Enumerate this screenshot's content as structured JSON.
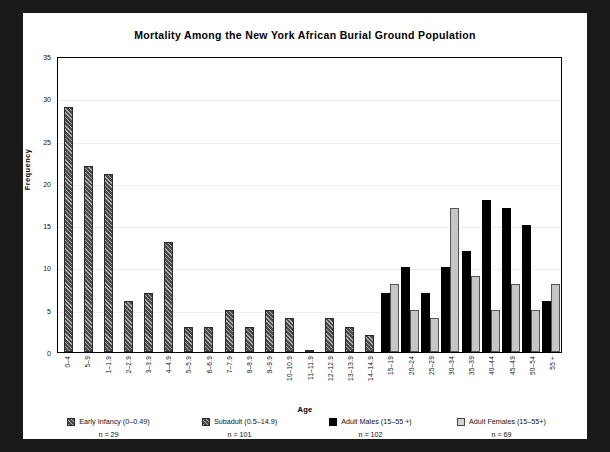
{
  "figure": {
    "title": "Mortality Among the New York African Burial Ground Population",
    "background": "#ffffff",
    "frame_color": "#1a1a1a"
  },
  "axes": {
    "x_label": "Age",
    "y_label": "Frequency",
    "y_ticks": [
      "0",
      "5",
      "10",
      "15",
      "20",
      "25",
      "30",
      "35"
    ]
  },
  "legend": {
    "items": [
      {
        "label": "Early Infancy (0–0.49)",
        "n": "n = 29",
        "swatch": "hatch",
        "color": "#4a4a4a"
      },
      {
        "label": "Subadult (0.5–14.9)",
        "n": "n = 101",
        "swatch": "hatch",
        "color": "#4a4a4a"
      },
      {
        "label": "Adult Males (15–55 +)",
        "n": "n = 102",
        "swatch": "black",
        "color": "#000000"
      },
      {
        "label": "Adult Females (15–55+)",
        "n": "n = 69",
        "swatch": "lightgray",
        "color": "#c6c6c6"
      }
    ]
  },
  "chart_data": {
    "type": "bar",
    "title": "Mortality Among the New York African Burial Ground Population",
    "xlabel": "Age",
    "ylabel": "Frequency",
    "ylim": [
      0,
      35
    ],
    "ytick_step": 5,
    "grid": true,
    "legend_position": "bottom",
    "categories": [
      "0–4",
      "5–9",
      "1–1.9",
      "2–2.9",
      "3–3.9",
      "4–4.9",
      "5–5.9",
      "6–6.9",
      "7–7.9",
      "8–8.9",
      "9–9.9",
      "10–10.9",
      "11–11.9",
      "12–12.9",
      "13–13.9",
      "14–14.9",
      "15–19",
      "20–24",
      "25–29",
      "30–34",
      "35–39",
      "40–44",
      "45–49",
      "50–54",
      "55 +"
    ],
    "series": [
      {
        "name": "Early Infancy / Subadult",
        "style": "hatch",
        "values": [
          29,
          22,
          21,
          6,
          7,
          13,
          3,
          3,
          5,
          3,
          5,
          4,
          0,
          4,
          3,
          2,
          null,
          null,
          null,
          null,
          null,
          null,
          null,
          null,
          null
        ]
      },
      {
        "name": "Adult Males (15–55 +)",
        "style": "black",
        "values": [
          null,
          null,
          null,
          null,
          null,
          null,
          null,
          null,
          null,
          null,
          null,
          null,
          null,
          null,
          null,
          null,
          7,
          10,
          7,
          10,
          12,
          18,
          17,
          15,
          6
        ]
      },
      {
        "name": "Adult Females (15–55+)",
        "style": "lightgray",
        "values": [
          null,
          null,
          null,
          null,
          null,
          null,
          null,
          null,
          null,
          null,
          null,
          null,
          null,
          null,
          null,
          null,
          8,
          5,
          4,
          17,
          9,
          5,
          8,
          5,
          8
        ]
      }
    ]
  }
}
